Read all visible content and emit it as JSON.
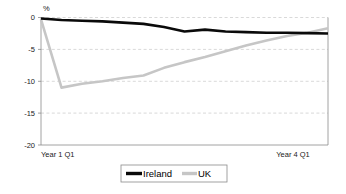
{
  "chart_data": {
    "type": "line",
    "title": "",
    "subtitle": "",
    "xlabel": "",
    "ylabel": "%",
    "ylim": [
      -20,
      0
    ],
    "yticks": [
      0,
      -5,
      -10,
      -15,
      -20
    ],
    "ytick_labels": [
      "0",
      "-5",
      "-10",
      "-15",
      "-20"
    ],
    "grid": true,
    "grid_axis": "y",
    "legend_position": "bottom-center",
    "x": [
      0,
      1,
      2,
      3,
      4,
      5,
      6,
      7,
      8,
      9,
      10,
      11,
      12,
      13,
      14
    ],
    "xticks": [
      0,
      12
    ],
    "xtick_labels": [
      "Year 1 Q1",
      "Year 4 Q1"
    ],
    "xtick_label_first": "Year 1 Q1",
    "xtick_label_last": "Year 4 Q1",
    "series": [
      {
        "name": "Ireland",
        "color": "#0a0a0a",
        "width": 2.6,
        "values": [
          -0.15,
          -0.4,
          -0.5,
          -0.6,
          -0.8,
          -1.0,
          -1.5,
          -2.2,
          -1.9,
          -2.2,
          -2.3,
          -2.4,
          -2.4,
          -2.45,
          -2.5
        ]
      },
      {
        "name": "UK",
        "color": "#c6c6c6",
        "width": 2.6,
        "values": [
          -0.3,
          -11.0,
          -10.4,
          -10.0,
          -9.5,
          -9.1,
          -7.9,
          -7.0,
          -6.2,
          -5.3,
          -4.4,
          -3.6,
          -2.9,
          -2.4,
          -1.7
        ]
      }
    ]
  },
  "legend": {
    "items": [
      {
        "label": "Ireland",
        "color": "#0a0a0a"
      },
      {
        "label": "UK",
        "color": "#c6c6c6"
      }
    ]
  },
  "axes": {
    "y_unit_label": "%",
    "y_labels": [
      "0",
      "-5",
      "-10",
      "-15",
      "-20"
    ],
    "x_labels": [
      "Year 1 Q1",
      "Year 4 Q1"
    ]
  }
}
